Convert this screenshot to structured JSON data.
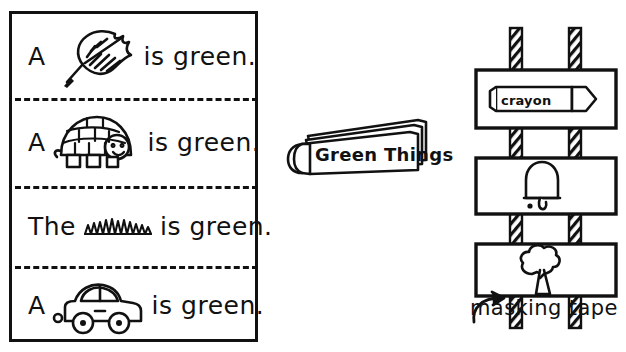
{
  "page": {
    "background_color": "#ffffff",
    "ink_color": "#111111"
  },
  "strip_panel": {
    "border_color": "#111111",
    "separator_style": "dashed",
    "rows": [
      {
        "lead_word": "A",
        "picture": "leaf-icon",
        "picture_name": "leaf",
        "tail_words": "is green."
      },
      {
        "lead_word": "A",
        "picture": "turtle-icon",
        "picture_name": "turtle",
        "tail_words": "is green."
      },
      {
        "lead_word": "The",
        "picture": "grass-icon",
        "picture_name": "grass",
        "tail_words": "is green."
      },
      {
        "lead_word": "A",
        "picture": "car-icon",
        "picture_name": "car",
        "tail_words": "is green."
      }
    ]
  },
  "book": {
    "cover_title": "Green Things",
    "icon": "book-icon"
  },
  "rack": {
    "tape_label": "masking tape",
    "arrow": "curved-arrow-icon",
    "tape_strip_count": 2,
    "cards": [
      {
        "picture": "crayon-icon",
        "picture_name": "crayon",
        "label_on_picture": "crayon"
      },
      {
        "picture": "bell-icon",
        "picture_name": "bell",
        "label_on_picture": ""
      },
      {
        "picture": "tree-icon",
        "picture_name": "tree",
        "label_on_picture": ""
      }
    ]
  }
}
